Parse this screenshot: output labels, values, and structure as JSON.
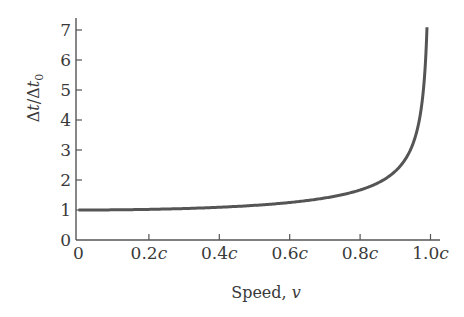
{
  "chart_data": {
    "type": "line",
    "title": "",
    "xlabel": "Speed, v",
    "xlabel_parts": {
      "text": "Speed, ",
      "var": "v"
    },
    "ylabel": "Δt/Δt0",
    "ylabel_parts": {
      "a": "Δ",
      "b": "t",
      "c": "/Δ",
      "d": "t",
      "sub": "0"
    },
    "xlim": [
      0,
      1.0
    ],
    "ylim": [
      0,
      7
    ],
    "grid": false,
    "legend": null,
    "x_ticks": [
      {
        "value": 0,
        "label": "0",
        "unit": ""
      },
      {
        "value": 0.2,
        "label": "0.2",
        "unit": "c"
      },
      {
        "value": 0.4,
        "label": "0.4",
        "unit": "c"
      },
      {
        "value": 0.6,
        "label": "0.6",
        "unit": "c"
      },
      {
        "value": 0.8,
        "label": "0.8",
        "unit": "c"
      },
      {
        "value": 1.0,
        "label": "1.0",
        "unit": "c"
      }
    ],
    "y_ticks": [
      0,
      1,
      2,
      3,
      4,
      5,
      6,
      7
    ],
    "series": [
      {
        "name": "Time dilation factor 1/sqrt(1 - v²/c²)",
        "color": "#555555",
        "x": [
          0,
          0.1,
          0.2,
          0.3,
          0.4,
          0.5,
          0.6,
          0.7,
          0.8,
          0.85,
          0.9,
          0.93,
          0.95,
          0.97,
          0.98,
          0.99
        ],
        "y": [
          1.0,
          1.005,
          1.021,
          1.048,
          1.091,
          1.155,
          1.25,
          1.4,
          1.667,
          1.898,
          2.294,
          2.72,
          3.203,
          4.113,
          5.025,
          7.089
        ]
      }
    ]
  }
}
